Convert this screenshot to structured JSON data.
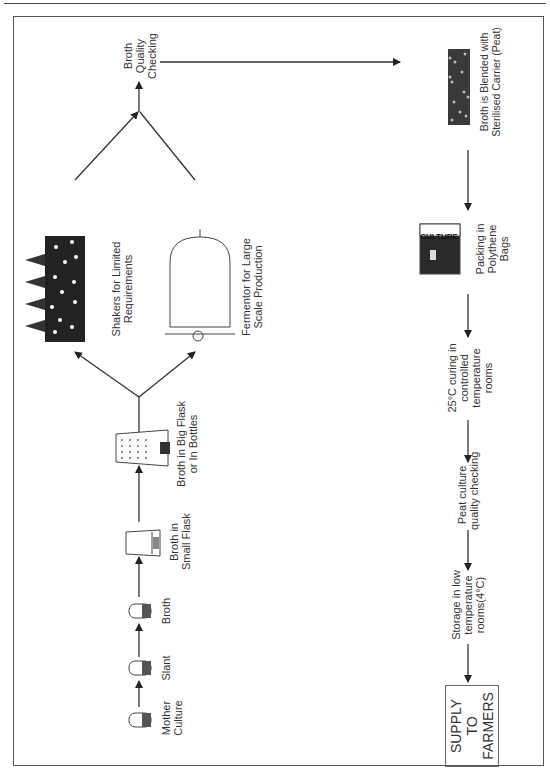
{
  "diagram": {
    "title": "",
    "orientation": "rotated -90deg (text reads bottom to top)",
    "stages": {
      "mother_culture": "Mother Culture",
      "slant": "Slant",
      "broth": "Broth",
      "small_flask": "Broth in Small Flask",
      "big_flask": "Broth in Big Flask or In Bottles",
      "shakers": "Shakers for Limited Requirements",
      "fermentor": "Fermentor for Large Scale Production",
      "quality_check": "Broth Quality Checking",
      "blended": "Broth is Blended with Sterilised Carrier (Peat)",
      "packing": "Packing in Polythene Bags",
      "curing": "25°C curing in controlled temperature rooms",
      "peat_check": "Peat culture quality checking",
      "storage": "Storage in low temperature rooms(4°C)",
      "supply": "SUPPLY TO FARMERS"
    },
    "labels": {
      "mother_culture": [
        "Mother",
        "Culture"
      ],
      "slant": [
        "Slant"
      ],
      "broth": [
        "Broth"
      ],
      "small_flask": [
        "Broth in",
        "Small Flask"
      ],
      "big_flask": [
        "Broth in Big Flask",
        "or In Bottles"
      ],
      "shakers": [
        "Shakers for Limited",
        "Requirements"
      ],
      "fermentor": [
        "Fermentor for Large",
        "Scale Production"
      ],
      "quality_check": [
        "Broth",
        "Quality",
        "Checking"
      ],
      "blended": [
        "Broth is Blended with",
        "Sterilised Carrier (Peat)"
      ],
      "packing": [
        "Packing in",
        "Polythene",
        "Bags"
      ],
      "curing": [
        "25°C curing in",
        "controlled",
        "temperature",
        "rooms"
      ],
      "peat_check": [
        "Peat culture",
        "quality checking"
      ],
      "storage": [
        "Storage in low",
        "temperature",
        "rooms(4°C)"
      ],
      "supply": [
        "SUPPLY",
        "TO",
        "FARMERS"
      ]
    },
    "icons": {
      "bag_text": "CULTURE"
    },
    "flow": [
      [
        "Mother Culture",
        "Slant"
      ],
      [
        "Slant",
        "Broth"
      ],
      [
        "Broth",
        "Broth in Small Flask"
      ],
      [
        "Broth in Small Flask",
        "Broth in Big Flask or In Bottles"
      ],
      [
        "Broth in Big Flask or In Bottles",
        "Shakers for Limited Requirements"
      ],
      [
        "Broth in Big Flask or In Bottles",
        "Fermentor for Large Scale Production"
      ],
      [
        "Shakers for Limited Requirements",
        "Broth Quality Checking"
      ],
      [
        "Fermentor for Large Scale Production",
        "Broth Quality Checking"
      ],
      [
        "Broth Quality Checking",
        "Broth is Blended with Sterilised Carrier (Peat)"
      ],
      [
        "Broth is Blended with Sterilised Carrier (Peat)",
        "Packing in Polythene Bags"
      ],
      [
        "Packing in Polythene Bags",
        "25°C curing in controlled temperature rooms"
      ],
      [
        "25°C curing in controlled temperature rooms",
        "Peat culture quality checking"
      ],
      [
        "Peat culture quality checking",
        "Storage in low temperature rooms(4°C)"
      ],
      [
        "Storage in low temperature rooms(4°C)",
        "SUPPLY TO FARMERS"
      ]
    ]
  }
}
